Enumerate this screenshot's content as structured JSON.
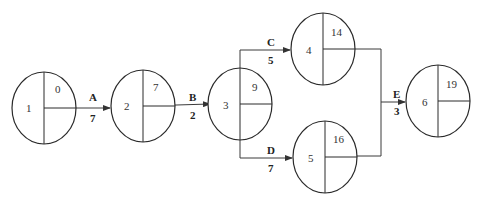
{
  "diagram": {
    "type": "activity-on-arrow network",
    "nodes": [
      {
        "id": "1",
        "earliest_time": "0"
      },
      {
        "id": "2",
        "earliest_time": "7"
      },
      {
        "id": "3",
        "earliest_time": "9"
      },
      {
        "id": "4",
        "earliest_time": "14"
      },
      {
        "id": "5",
        "earliest_time": "16"
      },
      {
        "id": "6",
        "earliest_time": "19"
      }
    ],
    "activities": [
      {
        "name": "A",
        "duration": "7",
        "from": "1",
        "to": "2"
      },
      {
        "name": "B",
        "duration": "2",
        "from": "2",
        "to": "3"
      },
      {
        "name": "C",
        "duration": "5",
        "from": "3",
        "to": "4"
      },
      {
        "name": "D",
        "duration": "7",
        "from": "3",
        "to": "5"
      },
      {
        "name": "E",
        "duration": "3",
        "from": "4,5",
        "to": "6"
      }
    ]
  }
}
